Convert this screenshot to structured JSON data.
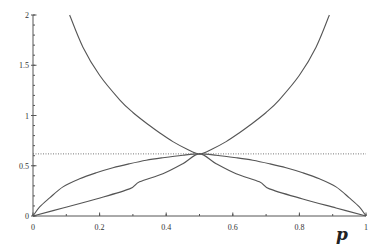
{
  "chart_data": {
    "type": "line",
    "title": "",
    "xlabel": "p",
    "ylabel": "",
    "xlim": [
      0,
      1
    ],
    "ylim": [
      0,
      2
    ],
    "grid": false,
    "legend": null,
    "x_ticks": [
      0,
      0.2,
      0.4,
      0.6,
      0.8,
      1
    ],
    "x_tick_labels": [
      "0",
      "0.2",
      "0.4",
      "0.6",
      "0.8",
      "1"
    ],
    "y_ticks": [
      0,
      0.5,
      1,
      1.5,
      2
    ],
    "y_tick_labels": [
      "0",
      "0.5",
      "1",
      "1.5",
      "2"
    ],
    "series": [
      {
        "name": "U-shaped curve",
        "style": "solid",
        "x": [
          0.11,
          0.15,
          0.2,
          0.261,
          0.3,
          0.35,
          0.381,
          0.42,
          0.46,
          0.5,
          0.54,
          0.58,
          0.619,
          0.65,
          0.7,
          0.739,
          0.8,
          0.85,
          0.89
        ],
        "y": [
          2.0,
          1.68,
          1.4,
          1.154,
          1.03,
          0.9,
          0.826,
          0.74,
          0.67,
          0.618,
          0.67,
          0.74,
          0.826,
          0.9,
          1.03,
          1.154,
          1.4,
          1.68,
          2.0
        ]
      },
      {
        "name": "Concave arch",
        "style": "solid",
        "x": [
          0,
          0.02,
          0.05,
          0.09,
          0.14,
          0.19,
          0.24,
          0.29,
          0.34,
          0.39,
          0.45,
          0.5,
          0.55,
          0.61,
          0.66,
          0.71,
          0.76,
          0.81,
          0.86,
          0.91,
          0.95,
          0.98,
          1
        ],
        "y": [
          0,
          0.09,
          0.18,
          0.29,
          0.37,
          0.43,
          0.48,
          0.52,
          0.555,
          0.58,
          0.605,
          0.618,
          0.605,
          0.58,
          0.555,
          0.52,
          0.48,
          0.43,
          0.37,
          0.29,
          0.18,
          0.09,
          0
        ]
      },
      {
        "name": "Lower curve",
        "style": "solid",
        "x": [
          0,
          0.09,
          0.19,
          0.29,
          0.32,
          0.39,
          0.45,
          0.5,
          0.55,
          0.61,
          0.68,
          0.71,
          0.81,
          0.91,
          1
        ],
        "y": [
          0,
          0.08,
          0.17,
          0.27,
          0.34,
          0.42,
          0.52,
          0.618,
          0.52,
          0.42,
          0.34,
          0.27,
          0.17,
          0.08,
          0
        ]
      },
      {
        "name": "Horizontal reference",
        "style": "dotted",
        "x": [
          0,
          1
        ],
        "y": [
          0.618,
          0.618
        ]
      }
    ]
  }
}
